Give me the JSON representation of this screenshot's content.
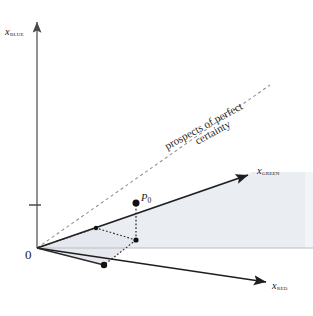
{
  "diagram": {
    "type": "3d-axes-diagram",
    "origin_label": "0",
    "point_label_name": "P",
    "point_label_subscript": "0",
    "certainty_line_caption_line1": "prospects of perfect",
    "certainty_line_caption_line2": "certainty",
    "axes": [
      {
        "name": "blue",
        "variable": "x",
        "channel": "BLUE",
        "label": "x",
        "subscript": "BLUE"
      },
      {
        "name": "green",
        "variable": "x",
        "channel": "GREEN",
        "label": "x",
        "subscript": "GREEN"
      },
      {
        "name": "red",
        "variable": "x",
        "channel": "RED",
        "label": "x",
        "subscript": "RED"
      }
    ],
    "colors": {
      "axis_stroke": "#4a4a4a",
      "heavy_stroke": "#1e1e1e",
      "faint_stroke": "#b9bdc4",
      "dashed_stroke": "#8c9096",
      "dotted_stroke": "#2a2a2a",
      "shade_fill": "#e7eaef",
      "point_fill": "#111111",
      "text": "#1b1b1b",
      "background": "#ffffff"
    },
    "geometry": {
      "origin": [
        37,
        248
      ],
      "blue_axis_tip": [
        37,
        18
      ],
      "blue_axis_tick_y": 205,
      "green_axis_tip": [
        253,
        172
      ],
      "red_axis_tip": [
        272,
        285
      ],
      "certainty_ray_tip": [
        270,
        85
      ],
      "point_p0": [
        136,
        203
      ],
      "p0_foot": [
        136,
        240
      ],
      "red_axis_marker": [
        104,
        265
      ],
      "horizon_y": 248,
      "horizon_x_end": 313
    }
  }
}
